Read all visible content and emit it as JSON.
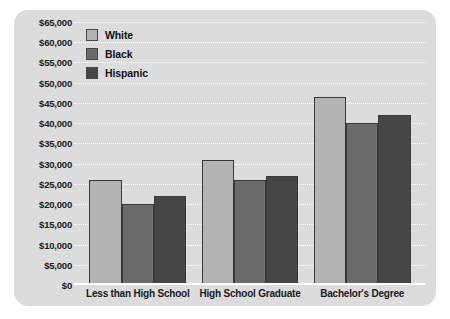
{
  "chart_data": {
    "type": "bar",
    "title": "",
    "xlabel": "",
    "ylabel": "",
    "ylim": [
      0,
      65000
    ],
    "ytick_step": 5000,
    "grid": true,
    "legend_position": "top-left",
    "categories": [
      "Less than High School",
      "High School Graduate",
      "Bachelor's Degree"
    ],
    "ytick_labels": [
      "$65,000",
      "$60,000",
      "$55,000",
      "$50,000",
      "$45,000",
      "$40,000",
      "$35,000",
      "$30,000",
      "$25,000",
      "$20,000",
      "$15,000",
      "$10,000",
      "$5,000",
      "$0"
    ],
    "ytick_values": [
      65000,
      60000,
      55000,
      50000,
      45000,
      40000,
      35000,
      30000,
      25000,
      20000,
      15000,
      10000,
      5000,
      0
    ],
    "series": [
      {
        "name": "White",
        "color": "#b3b3b3",
        "values": [
          26000,
          31000,
          46500
        ]
      },
      {
        "name": "Black",
        "color": "#6b6b6b",
        "values": [
          20000,
          26000,
          40000
        ]
      },
      {
        "name": "Hispanic",
        "color": "#454545",
        "values": [
          22000,
          27000,
          42000
        ]
      }
    ]
  },
  "style": {
    "card_background": "#dcdcdc",
    "page_background": "#ffffff",
    "gridline_color": "#ffffff",
    "text_color": "#1a1a1a",
    "bar_outline": "#3a3a3a"
  }
}
